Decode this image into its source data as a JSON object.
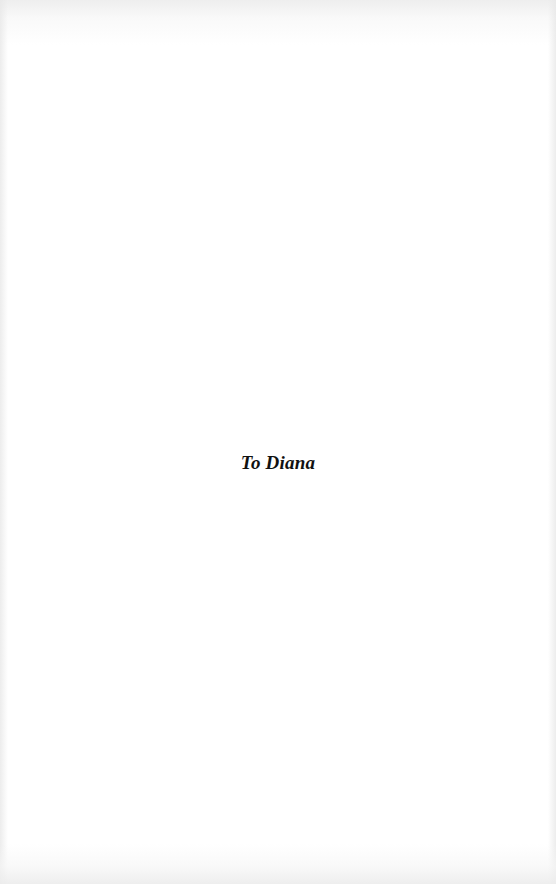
{
  "page": {
    "type": "dedication",
    "dedication_text": "To Diana"
  },
  "colors": {
    "background": "#ffffff",
    "text": "#111111"
  }
}
